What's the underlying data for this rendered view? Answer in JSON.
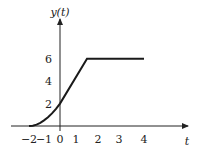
{
  "chart_data": {
    "type": "line",
    "title": "",
    "xlabel": "t",
    "ylabel": "y(t)",
    "x_ticks": [
      -2,
      -1,
      0,
      1,
      2,
      3,
      4
    ],
    "x_tick_labels": [
      "−2",
      "−1",
      "0",
      "1",
      "2",
      "3",
      "4"
    ],
    "y_ticks": [
      2,
      4,
      6
    ],
    "y_tick_labels": [
      "2",
      "4",
      "6"
    ],
    "xlim": [
      -2.5,
      5.2
    ],
    "ylim": [
      0,
      9.5
    ],
    "grid": false,
    "legend": "none",
    "series": [
      {
        "name": "y(t)",
        "x": [
          -2,
          -1.75,
          -1.5,
          -1.25,
          -1,
          -0.75,
          -0.5,
          -0.25,
          0,
          1.5,
          4
        ],
        "y": [
          0,
          0.03,
          0.125,
          0.28,
          0.5,
          0.78,
          1.125,
          1.53,
          2,
          6,
          6
        ]
      }
    ]
  }
}
